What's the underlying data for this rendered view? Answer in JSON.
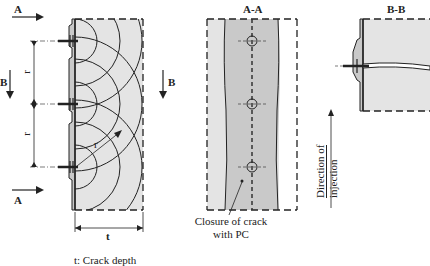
{
  "diagram": {
    "views": [
      {
        "id": "side",
        "labels": {
          "section_a_top": "A",
          "section_a_bottom": "A",
          "section_b": "B",
          "spacing_1": "r",
          "spacing_2": "r",
          "radius": "r",
          "depth": "t"
        }
      },
      {
        "id": "section_aa",
        "title": "A-A",
        "section_b": "B"
      },
      {
        "id": "section_bb",
        "title": "B-B"
      }
    ],
    "annotations": {
      "closure_line1": "Closure of crack",
      "closure_line2": "with PC",
      "direction_line1": "Direction of",
      "direction_line2": "injection"
    },
    "legend": {
      "crack_depth": "t: Crack depth"
    },
    "colors": {
      "fill_light": "#e4e4e4",
      "fill_dark": "#c9c9c9",
      "line": "#222222"
    }
  }
}
